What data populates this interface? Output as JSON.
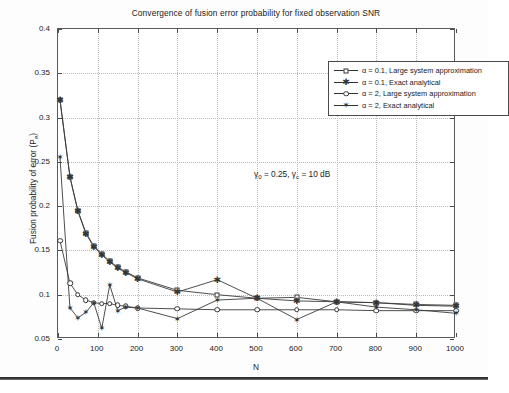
{
  "figure": {
    "title": "Convergence of fusion error probability for fixed observation SNR",
    "annotation": "γ₀ = 0.25, γᶜ = 10 dB",
    "annotation_parts": {
      "g0": "γ",
      "g0sub": "0",
      "mid": " = 0.25,  ",
      "gc": "γ",
      "gcsub": "c",
      "tail": " = 10 dB"
    }
  },
  "legend": {
    "position": "top-right",
    "items": [
      {
        "label": "α = 0.1, Large system approximation",
        "marker": "square-icon",
        "series": "alpha01_lsa"
      },
      {
        "label": "α = 0.1, Exact analytical",
        "marker": "asterisk-icon",
        "series": "alpha01_exact"
      },
      {
        "label": "α = 2, Large system approximation",
        "marker": "circle-icon",
        "series": "alpha2_lsa"
      },
      {
        "label": "α = 2, Exact analytical",
        "marker": "hexagram-icon",
        "series": "alpha2_exact"
      }
    ]
  },
  "chart_data": {
    "type": "line",
    "title": "Convergence of fusion error probability for fixed observation SNR",
    "xlabel": "N",
    "ylabel": "Fusion probability of error (P_e)",
    "ylabel_parts": {
      "main": "Fusion probability of error (P",
      "sub": "e",
      "tail": ")"
    },
    "xlim": [
      0,
      1000
    ],
    "ylim": [
      0.05,
      0.4
    ],
    "xticks": [
      0,
      100,
      200,
      300,
      400,
      500,
      600,
      700,
      800,
      900,
      1000
    ],
    "yticks": [
      0.05,
      0.1,
      0.15,
      0.2,
      0.25,
      0.3,
      0.35,
      0.4
    ],
    "xticklabels": [
      "0",
      "100",
      "200",
      "300",
      "400",
      "500",
      "600",
      "700",
      "800",
      "900",
      "1000"
    ],
    "yticklabels": [
      "0.05",
      "0.1",
      "0.15",
      "0.2",
      "0.25",
      "0.3",
      "0.35",
      "0.4"
    ],
    "grid": true,
    "annotations": [
      {
        "text": "γ₀ = 0.25, γᶜ = 10 dB",
        "x": 350,
        "y": 0.275
      }
    ],
    "series": [
      {
        "name": "α = 0.1, Large system approximation",
        "marker": "square",
        "x": [
          5,
          30,
          50,
          70,
          90,
          110,
          130,
          150,
          170,
          200,
          300,
          400,
          500,
          600,
          700,
          800,
          900,
          1000
        ],
        "y": [
          0.32,
          0.233,
          0.195,
          0.17,
          0.155,
          0.146,
          0.138,
          0.131,
          0.126,
          0.119,
          0.105,
          0.1,
          0.096,
          0.097,
          0.092,
          0.091,
          0.089,
          0.088
        ]
      },
      {
        "name": "α = 0.1, Exact analytical",
        "marker": "asterisk",
        "x": [
          5,
          30,
          50,
          70,
          90,
          110,
          130,
          150,
          170,
          200,
          300,
          400,
          500,
          600,
          700,
          800,
          900,
          1000
        ],
        "y": [
          0.32,
          0.233,
          0.194,
          0.169,
          0.154,
          0.145,
          0.137,
          0.13,
          0.125,
          0.118,
          0.103,
          0.117,
          0.096,
          0.093,
          0.092,
          0.091,
          0.088,
          0.087
        ]
      },
      {
        "name": "α = 2, Large system approximation",
        "marker": "circle",
        "x": [
          5,
          30,
          50,
          70,
          90,
          110,
          130,
          150,
          170,
          200,
          300,
          400,
          500,
          600,
          700,
          800,
          900,
          1000
        ],
        "y": [
          0.161,
          0.113,
          0.1,
          0.094,
          0.091,
          0.09,
          0.09,
          0.088,
          0.087,
          0.085,
          0.084,
          0.083,
          0.083,
          0.083,
          0.083,
          0.082,
          0.082,
          0.082
        ]
      },
      {
        "name": "α = 2, Exact analytical",
        "marker": "hexagram",
        "x": [
          5,
          30,
          50,
          70,
          90,
          110,
          130,
          150,
          170,
          200,
          300,
          400,
          500,
          600,
          700,
          800,
          900,
          1000
        ],
        "y": [
          0.255,
          0.085,
          0.074,
          0.08,
          0.091,
          0.062,
          0.111,
          0.082,
          0.086,
          0.085,
          0.073,
          0.094,
          0.096,
          0.072,
          0.092,
          0.086,
          0.083,
          0.079
        ]
      }
    ]
  }
}
